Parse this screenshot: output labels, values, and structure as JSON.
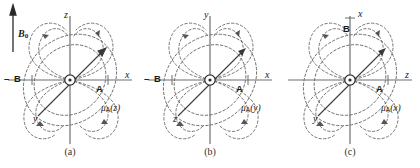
{
  "figure": {
    "background": "#ffffff",
    "axis_color": "#6f6f6f",
    "field_line_color": "#555555",
    "dipole_vector_color": "#3a3a3a",
    "text_color": "#1a1a1a"
  },
  "b0": {
    "label": "B",
    "subscript": "0",
    "arrow_direction": "up",
    "description": "static magnetic field direction arrow"
  },
  "panels": [
    {
      "id": "a",
      "caption": "(a)",
      "horizontal_axis": "x",
      "vertical_axis": "z",
      "diagonal_axis": "y",
      "diagonal_axis_direction": "down-left",
      "dipole_label": "μ",
      "dipole_subscript": "A",
      "dipole_argument": "(z)",
      "marker_right": "A",
      "marker_left": "B",
      "marker_left_prefix": "–",
      "nucleus": "spin-A"
    },
    {
      "id": "b",
      "caption": "(b)",
      "horizontal_axis": "x",
      "vertical_axis": "y",
      "diagonal_axis": "z",
      "diagonal_axis_direction": "down-left",
      "dipole_label": "μ",
      "dipole_subscript": "A",
      "dipole_argument": "(y)",
      "marker_right": "A",
      "marker_left": "B",
      "marker_left_prefix": "–",
      "nucleus": "spin-A"
    },
    {
      "id": "c",
      "caption": "(c)",
      "horizontal_axis": "z",
      "vertical_axis": "x",
      "diagonal_axis": "y",
      "diagonal_axis_direction": "down-left",
      "dipole_label": "μ",
      "dipole_subscript": "A",
      "dipole_argument": "(x)",
      "marker_right": "A",
      "marker_left": "B",
      "marker_left_prefix": "",
      "marker_top": "B",
      "nucleus": "spin-A"
    }
  ]
}
